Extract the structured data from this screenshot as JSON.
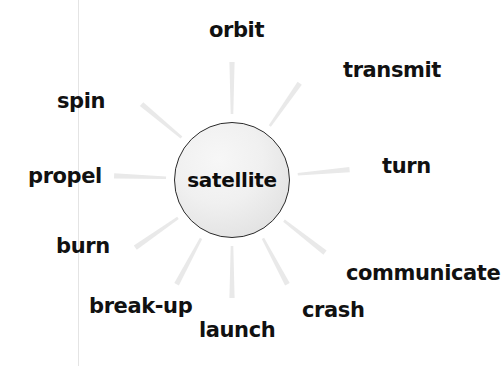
{
  "diagram": {
    "type": "word-web",
    "center": {
      "label": "satellite",
      "cx": 232,
      "cy": 180,
      "r": 58,
      "fill": "#ededed",
      "stroke": "#2a2a2a"
    },
    "ray_color": "#e9e9e9",
    "background": "#ffffff",
    "margin_rule_color": "#e4e4e4",
    "spokes": [
      {
        "label": "orbit",
        "angle_deg": 90,
        "x": 209,
        "y": 20,
        "ray_start": 66,
        "ray_end": 118
      },
      {
        "label": "transmit",
        "angle_deg": 55,
        "x": 343,
        "y": 60,
        "ray_start": 66,
        "ray_end": 118
      },
      {
        "label": "turn",
        "angle_deg": 5,
        "x": 382,
        "y": 156,
        "ray_start": 66,
        "ray_end": 118
      },
      {
        "label": "communicate",
        "angle_deg": -38,
        "x": 346,
        "y": 263,
        "ray_start": 66,
        "ray_end": 118
      },
      {
        "label": "crash",
        "angle_deg": -62,
        "x": 302,
        "y": 300,
        "ray_start": 66,
        "ray_end": 118
      },
      {
        "label": "launch",
        "angle_deg": -90,
        "x": 199,
        "y": 320,
        "ray_start": 66,
        "ray_end": 118
      },
      {
        "label": "break-up",
        "angle_deg": -118,
        "x": 89,
        "y": 296,
        "ray_start": 66,
        "ray_end": 118
      },
      {
        "label": "burn",
        "angle_deg": -145,
        "x": 56,
        "y": 236,
        "ray_start": 66,
        "ray_end": 118
      },
      {
        "label": "propel",
        "angle_deg": 178,
        "x": 28,
        "y": 166,
        "ray_start": 66,
        "ray_end": 118
      },
      {
        "label": "spin",
        "angle_deg": 140,
        "x": 57,
        "y": 91,
        "ray_start": 66,
        "ray_end": 118
      }
    ],
    "margin_rule_x": 78
  }
}
